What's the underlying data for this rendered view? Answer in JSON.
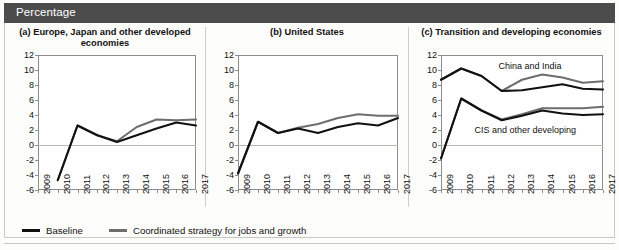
{
  "header": {
    "title": "Percentage"
  },
  "legend": [
    {
      "label": "Baseline",
      "color": "#111111"
    },
    {
      "label": "Coordinated strategy for jobs and growth",
      "color": "#6e6e6e"
    }
  ],
  "colors": {
    "baseline": "#111111",
    "coordinated": "#6e6e6e",
    "header_bar": "#4c4c4c",
    "axis": "#8d8d8d",
    "zero_line": "#b9b9b4"
  },
  "chart_data": [
    {
      "type": "line",
      "panel": "a",
      "title": "(a) Europe, Japan and other developed economies",
      "xlabel": "",
      "ylabel": "Percentage",
      "x": [
        "2009",
        "2010",
        "2011",
        "2012",
        "2013",
        "2014",
        "2015",
        "2016",
        "2017"
      ],
      "ylim": [
        -6,
        12
      ],
      "yticks": [
        12,
        10,
        8,
        6,
        4,
        2,
        0,
        -2,
        -4,
        -6
      ],
      "grid": false,
      "legend_position": "bottom",
      "series": [
        {
          "name": "Baseline",
          "color": "#111111",
          "values": [
            null,
            -4.7,
            2.6,
            1.3,
            0.4,
            1.3,
            2.2,
            3.0,
            2.6
          ]
        },
        {
          "name": "Coordinated strategy for jobs and growth",
          "color": "#6e6e6e",
          "values": [
            null,
            -4.7,
            2.6,
            1.3,
            0.5,
            2.4,
            3.4,
            3.3,
            3.4
          ]
        }
      ],
      "annotations": []
    },
    {
      "type": "line",
      "panel": "b",
      "title": "(b) United States",
      "xlabel": "",
      "ylabel": "Percentage",
      "x": [
        "2009",
        "2010",
        "2011",
        "2012",
        "2013",
        "2014",
        "2015",
        "2016",
        "2017"
      ],
      "ylim": [
        -6,
        12
      ],
      "yticks": [
        12,
        10,
        8,
        6,
        4,
        2,
        0,
        -2,
        -4,
        -6
      ],
      "grid": false,
      "legend_position": "bottom",
      "series": [
        {
          "name": "Baseline",
          "color": "#111111",
          "values": [
            -3.8,
            3.1,
            1.6,
            2.2,
            1.6,
            2.4,
            2.9,
            2.6,
            3.6
          ]
        },
        {
          "name": "Coordinated strategy for jobs and growth",
          "color": "#6e6e6e",
          "values": [
            -3.8,
            3.1,
            1.6,
            2.3,
            2.8,
            3.6,
            4.1,
            3.9,
            3.9
          ]
        }
      ],
      "annotations": []
    },
    {
      "type": "line",
      "panel": "c",
      "title": "(c) Transition and developing economies",
      "xlabel": "",
      "ylabel": "Percentage",
      "x": [
        "2009",
        "2010",
        "2011",
        "2012",
        "2013",
        "2014",
        "2015",
        "2016",
        "2017"
      ],
      "ylim": [
        -6,
        12
      ],
      "yticks": [
        12,
        10,
        8,
        6,
        4,
        2,
        0,
        -2,
        -4,
        -6
      ],
      "grid": false,
      "legend_position": "bottom",
      "series": [
        {
          "name": "China and India - Baseline",
          "group": "China and India",
          "color": "#111111",
          "values": [
            8.7,
            10.2,
            9.2,
            7.2,
            7.3,
            7.7,
            8.1,
            7.5,
            7.4
          ]
        },
        {
          "name": "China and India - Coordinated strategy for jobs and growth",
          "group": "China and India",
          "color": "#6e6e6e",
          "values": [
            8.7,
            10.2,
            9.2,
            7.2,
            8.7,
            9.4,
            9.0,
            8.3,
            8.5
          ]
        },
        {
          "name": "CIS and other developing - Baseline",
          "group": "CIS and other developing",
          "color": "#111111",
          "values": [
            -1.8,
            6.2,
            4.6,
            3.3,
            3.9,
            4.6,
            4.2,
            4.0,
            4.1
          ]
        },
        {
          "name": "CIS and other developing - Coordinated strategy for jobs and growth",
          "group": "CIS and other developing",
          "color": "#6e6e6e",
          "values": [
            -1.8,
            6.2,
            4.6,
            3.4,
            4.1,
            4.9,
            4.9,
            4.9,
            5.1
          ]
        }
      ],
      "annotations": [
        {
          "text": "China and India",
          "x_frac": 0.55,
          "value": 10.4
        },
        {
          "text": "CIS and other developing",
          "x_frac": 0.52,
          "value": 1.9
        }
      ]
    }
  ]
}
